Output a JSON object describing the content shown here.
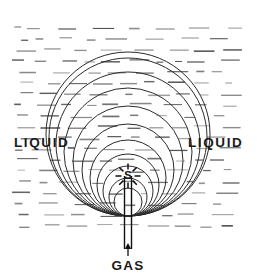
{
  "figure": {
    "type": "technical-line-diagram",
    "background_color": "#ffffff",
    "ink_color": "#1a1a1a",
    "width": 257,
    "height": 277
  },
  "labels": {
    "liquid_left": "LIQUID",
    "liquid_right": "LIQUID",
    "gas": "GAS",
    "center_mark": "S"
  },
  "geometry": {
    "nozzle_tip": {
      "x": 128,
      "y": 176
    },
    "tangent_point": {
      "x": 128,
      "y": 216
    },
    "nozzle_tube": {
      "left_x": 124.5,
      "right_x": 131.5,
      "top_y": 176,
      "bottom_y": 249
    },
    "burst": {
      "center_x": 128,
      "center_y": 176,
      "ray_count": 8,
      "inner_radius": 6.5,
      "outer_radius": 12.5
    },
    "arrow": {
      "x": 128,
      "from_y": 256,
      "to_y": 243
    }
  },
  "bubbles": {
    "note": "Nested circles sharing a common lower tangent at the nozzle, representing successive bubble growth stages.",
    "tangent_y": 216,
    "center_x": 128,
    "radii": [
      14,
      19,
      25,
      31,
      38,
      46,
      55,
      64,
      72,
      79,
      82
    ]
  },
  "hatching": {
    "note": "Short horizontal dashes filling the liquid field around the bubble outlines.",
    "field": {
      "x": 12,
      "y": 28,
      "width": 233,
      "height": 200
    },
    "row_spacing": 11,
    "dash_color": "#4a4a4a"
  },
  "label_positions": {
    "liquid_left": {
      "x": 14,
      "y": 147
    },
    "liquid_right": {
      "x": 188,
      "y": 147
    },
    "gas": {
      "x": 128,
      "y": 270
    }
  }
}
